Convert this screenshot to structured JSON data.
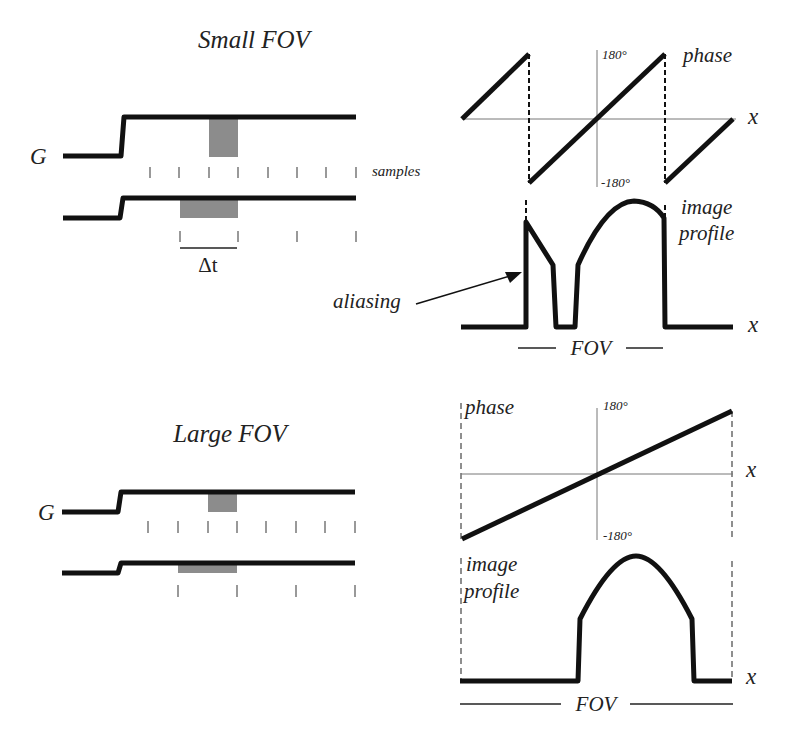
{
  "small_fov": {
    "title": "Small FOV",
    "gradient_label": "G",
    "samples_label": "samples",
    "delta_t_label": "Δt",
    "phase_label": "phase",
    "phase_max": "180°",
    "phase_min": "-180°",
    "x_label": "x",
    "profile_label_1": "image",
    "profile_label_2": "profile",
    "profile_x_label": "x",
    "aliasing_label": "aliasing",
    "fov_label": "FOV"
  },
  "large_fov": {
    "title": "Large FOV",
    "gradient_label": "G",
    "phase_label": "phase",
    "phase_max": "180°",
    "phase_min": "-180°",
    "x_label": "x",
    "profile_label_1": "image",
    "profile_label_2": "profile",
    "profile_x_label": "x",
    "fov_label": "FOV"
  },
  "colors": {
    "trace": "#111111",
    "shaded_box": "#8c8c8c",
    "axis": "#777777"
  }
}
